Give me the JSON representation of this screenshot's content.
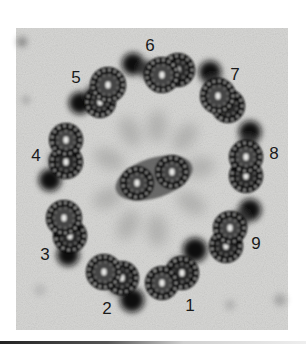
{
  "figure": {
    "frame": {
      "x": 16,
      "y": 28,
      "width": 272,
      "height": 302
    },
    "colors": {
      "background": "#ffffff",
      "film": "#d6d6d4",
      "film_light": "#e4e4e2",
      "stain_dark": "#111111",
      "stain_mid": "#3a3a3a",
      "haze": "#9a9a98",
      "dot": "#c8c8c6",
      "label": "#1a1a1a",
      "rule_dark": "#222222",
      "rule_light": "#e8e8e8"
    }
  },
  "labels": [
    {
      "text": "1",
      "x": 190,
      "y": 305
    },
    {
      "text": "2",
      "x": 107,
      "y": 308
    },
    {
      "text": "3",
      "x": 45,
      "y": 254
    },
    {
      "text": "4",
      "x": 36,
      "y": 155
    },
    {
      "text": "5",
      "x": 76,
      "y": 77
    },
    {
      "text": "6",
      "x": 150,
      "y": 45
    },
    {
      "text": "7",
      "x": 235,
      "y": 74
    },
    {
      "text": "8",
      "x": 274,
      "y": 153
    },
    {
      "text": "9",
      "x": 256,
      "y": 243
    }
  ],
  "doublets": [
    {
      "id": 1,
      "a": [
        162,
        283,
        14
      ],
      "b": [
        182,
        273,
        14
      ],
      "arm": [
        195,
        250,
        12
      ]
    },
    {
      "id": 2,
      "a": [
        104,
        272,
        15
      ],
      "b": [
        122,
        278,
        14
      ],
      "arm": [
        132,
        300,
        12
      ]
    },
    {
      "id": 3,
      "a": [
        64,
        218,
        15
      ],
      "b": [
        70,
        236,
        14
      ],
      "arm": [
        68,
        255,
        11
      ]
    },
    {
      "id": 4,
      "a": [
        66,
        140,
        14
      ],
      "b": [
        66,
        162,
        14
      ],
      "arm": [
        50,
        180,
        11
      ]
    },
    {
      "id": 5,
      "a": [
        108,
        85,
        15
      ],
      "b": [
        100,
        102,
        13
      ],
      "arm": [
        80,
        103,
        11
      ]
    },
    {
      "id": 6,
      "a": [
        162,
        75,
        15
      ],
      "b": [
        178,
        70,
        14
      ],
      "arm": [
        133,
        64,
        11
      ]
    },
    {
      "id": 7,
      "a": [
        218,
        96,
        15
      ],
      "b": [
        228,
        106,
        14
      ],
      "arm": [
        210,
        72,
        11
      ]
    },
    {
      "id": 8,
      "a": [
        246,
        157,
        14
      ],
      "b": [
        246,
        176,
        14
      ],
      "arm": [
        250,
        132,
        11
      ]
    },
    {
      "id": 9,
      "a": [
        230,
        228,
        14
      ],
      "b": [
        226,
        246,
        14
      ],
      "arm": [
        250,
        210,
        11
      ]
    }
  ],
  "central_pair": [
    {
      "x": 137,
      "y": 183,
      "r": 14
    },
    {
      "x": 172,
      "y": 172,
      "r": 14
    }
  ]
}
